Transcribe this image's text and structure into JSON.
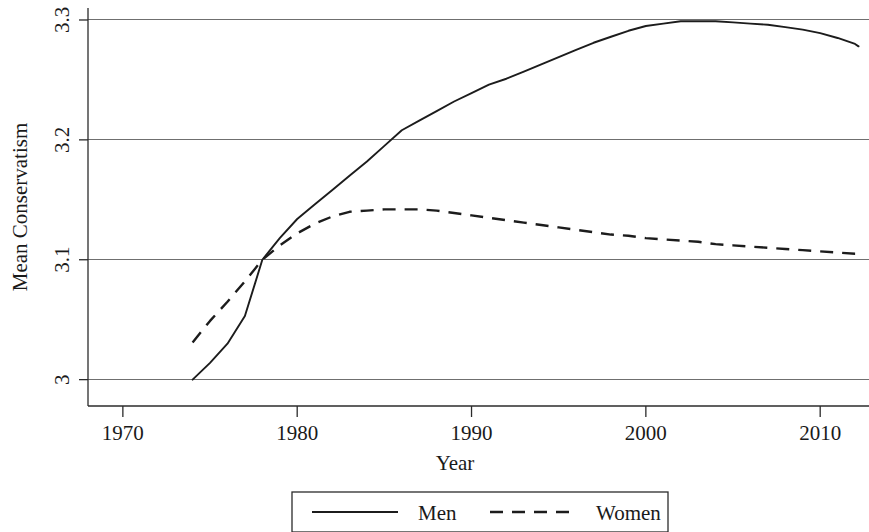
{
  "chart_data": {
    "type": "line",
    "title": "",
    "xlabel": "Year",
    "ylabel": "Mean Conservatism",
    "xlim": [
      1968,
      2012.8
    ],
    "ylim": [
      2.978,
      3.31
    ],
    "xticks": [
      1970,
      1980,
      1990,
      2000,
      2010
    ],
    "xtick_labels": [
      "1970",
      "1980",
      "1990",
      "2000",
      "2010"
    ],
    "yticks": [
      3.0,
      3.1,
      3.2,
      3.3
    ],
    "ytick_labels": [
      "3",
      "3.1",
      "3.2",
      "3.3"
    ],
    "grid": "horizontal",
    "legend_position": "below-center",
    "series": [
      {
        "name": "Men",
        "style": "solid",
        "color": "#1c1c1c",
        "x": [
          1974,
          1975,
          1976,
          1977,
          1978,
          1979,
          1980,
          1981,
          1982,
          1983,
          1984,
          1985,
          1986,
          1987,
          1988,
          1989,
          1990,
          1991,
          1992,
          1993,
          1994,
          1995,
          1996,
          1997,
          1998,
          1999,
          2000,
          2001,
          2002,
          2003,
          2004,
          2005,
          2006,
          2007,
          2008,
          2009,
          2010,
          2011,
          2012,
          2012.2
        ],
        "values": [
          3.0,
          3.014,
          3.03,
          3.053,
          3.1,
          3.118,
          3.134,
          3.146,
          3.158,
          3.17,
          3.182,
          3.195,
          3.208,
          3.216,
          3.224,
          3.232,
          3.239,
          3.246,
          3.251,
          3.257,
          3.263,
          3.269,
          3.275,
          3.281,
          3.286,
          3.291,
          3.295,
          3.297,
          3.299,
          3.299,
          3.299,
          3.298,
          3.297,
          3.296,
          3.294,
          3.292,
          3.289,
          3.285,
          3.28,
          3.278
        ]
      },
      {
        "name": "Women",
        "style": "dashed",
        "color": "#1c1c1c",
        "x": [
          1974,
          1975,
          1976,
          1977,
          1978,
          1979,
          1980,
          1981,
          1982,
          1983,
          1984,
          1985,
          1986,
          1987,
          1988,
          1989,
          1990,
          1991,
          1992,
          1993,
          1994,
          1995,
          1996,
          1997,
          1998,
          1999,
          2000,
          2001,
          2002,
          2003,
          2004,
          2005,
          2006,
          2007,
          2008,
          2009,
          2010,
          2011,
          2012,
          2012.2
        ],
        "values": [
          3.031,
          3.049,
          3.065,
          3.082,
          3.1,
          3.112,
          3.122,
          3.13,
          3.136,
          3.14,
          3.141,
          3.142,
          3.142,
          3.142,
          3.141,
          3.139,
          3.137,
          3.135,
          3.133,
          3.131,
          3.129,
          3.127,
          3.125,
          3.123,
          3.121,
          3.12,
          3.118,
          3.117,
          3.116,
          3.115,
          3.113,
          3.112,
          3.111,
          3.11,
          3.109,
          3.108,
          3.107,
          3.106,
          3.105,
          3.105
        ]
      }
    ],
    "annotations": []
  },
  "legend": {
    "entries": [
      {
        "label": "Men",
        "style": "solid"
      },
      {
        "label": "Women",
        "style": "dashed"
      }
    ]
  }
}
